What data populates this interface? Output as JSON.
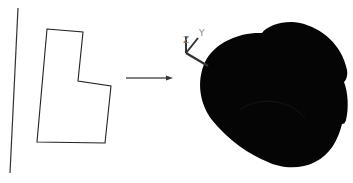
{
  "diagram": {
    "type": "revolve-operation",
    "left": {
      "rotation_axis": {
        "x1": 18,
        "y1": 8,
        "x2": 10,
        "y2": 173,
        "color": "#333333"
      },
      "profile": {
        "points": "47,29 83,32 78,81 111,86 105,143 37,142",
        "color": "#222222"
      }
    },
    "arrow": {
      "x1": 126,
      "y1": 78,
      "x2": 172,
      "y2": 78,
      "color": "#555555"
    },
    "right": {
      "solid_color": "#050505",
      "triad": {
        "labels": {
          "z": "Z",
          "y": "Y"
        },
        "color": "#333333"
      }
    }
  }
}
